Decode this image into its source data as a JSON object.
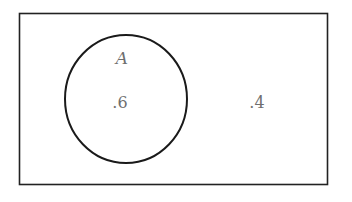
{
  "diagram": {
    "type": "venn",
    "universe": {
      "x": 19,
      "y": 13,
      "width": 308,
      "height": 171,
      "stroke": "#222222",
      "outside_value": ".4"
    },
    "sets": [
      {
        "name": "A",
        "cx": 126,
        "cy": 99,
        "rx": 61,
        "ry": 64,
        "stroke": "#1a1a1a",
        "value": ".6"
      }
    ],
    "text_color": "#6f6f6f"
  }
}
